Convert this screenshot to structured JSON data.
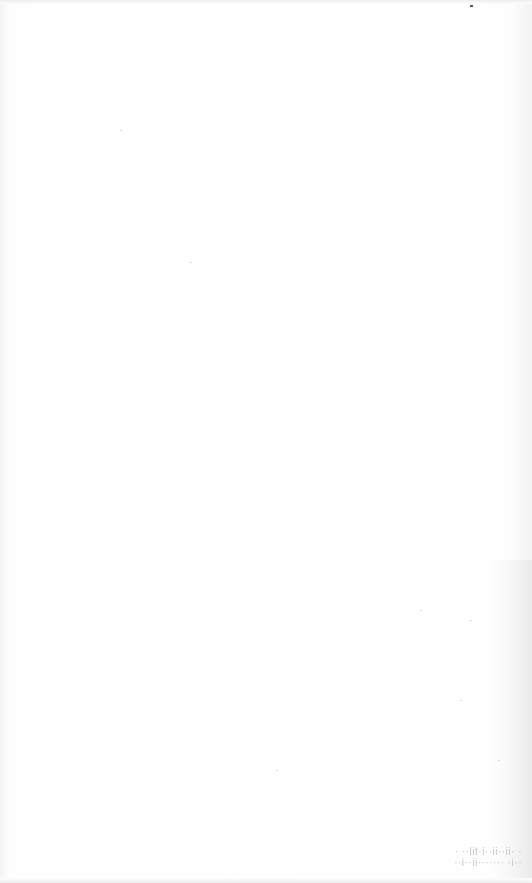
{
  "page": {
    "background_color": "#fdfdfd"
  },
  "footer_faint_text": {
    "line1": "· ··lit·i··ii··ii· ·",
    "line2": "··i··ii······· ·i··",
    "legible": false
  }
}
